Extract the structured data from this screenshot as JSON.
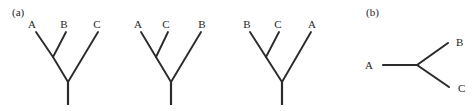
{
  "figure": {
    "width": 474,
    "height": 111,
    "background": "#ffffff",
    "line_color": "#2b2b2b",
    "text_color": "#262626"
  },
  "panels": [
    {
      "id": "a",
      "label": "(a)",
      "x": 12,
      "y": 16
    },
    {
      "id": "b",
      "label": "(b)",
      "x": 366,
      "y": 16
    }
  ],
  "rooted_trees": [
    {
      "name": "tree-1",
      "topology": "((A,B),C)",
      "leaves": [
        {
          "label": "A",
          "label_x": 32,
          "label_y": 28,
          "tip_x": 36,
          "tip_y": 32
        },
        {
          "label": "B",
          "label_x": 64,
          "label_y": 28,
          "tip_x": 66,
          "tip_y": 32
        },
        {
          "label": "C",
          "label_x": 97,
          "label_y": 28,
          "tip_x": 98,
          "tip_y": 32
        }
      ],
      "internal_node": {
        "x": 53,
        "y": 57
      },
      "root_node": {
        "x": 68,
        "y": 82
      },
      "stem_bottom": {
        "x": 68,
        "y": 105
      }
    },
    {
      "name": "tree-2",
      "topology": "((A,C),B)",
      "leaves": [
        {
          "label": "A",
          "label_x": 138,
          "label_y": 28,
          "tip_x": 141,
          "tip_y": 32
        },
        {
          "label": "C",
          "label_x": 166,
          "label_y": 28,
          "tip_x": 168,
          "tip_y": 32
        },
        {
          "label": "B",
          "label_x": 202,
          "label_y": 28,
          "tip_x": 201,
          "tip_y": 32
        }
      ],
      "internal_node": {
        "x": 156,
        "y": 57
      },
      "root_node": {
        "x": 171,
        "y": 82
      },
      "stem_bottom": {
        "x": 171,
        "y": 105
      }
    },
    {
      "name": "tree-3",
      "topology": "((B,C),A)",
      "leaves": [
        {
          "label": "B",
          "label_x": 247,
          "label_y": 28,
          "tip_x": 250,
          "tip_y": 32
        },
        {
          "label": "C",
          "label_x": 278,
          "label_y": 28,
          "tip_x": 279,
          "tip_y": 32
        },
        {
          "label": "A",
          "label_x": 312,
          "label_y": 28,
          "tip_x": 311,
          "tip_y": 32
        }
      ],
      "internal_node": {
        "x": 266,
        "y": 57
      },
      "root_node": {
        "x": 282,
        "y": 82
      },
      "stem_bottom": {
        "x": 282,
        "y": 105
      }
    }
  ],
  "unrooted_tree": {
    "name": "unrooted-tree",
    "topology": "(A,B,C)",
    "center_node": {
      "x": 417,
      "y": 65
    },
    "leaves": [
      {
        "label": "A",
        "label_x": 373,
        "label_y": 69,
        "tip_x": 383,
        "tip_y": 65
      },
      {
        "label": "B",
        "label_x": 456,
        "label_y": 46,
        "tip_x": 448,
        "tip_y": 43
      },
      {
        "label": "C",
        "label_x": 458,
        "label_y": 92,
        "tip_x": 449,
        "tip_y": 87
      }
    ]
  }
}
